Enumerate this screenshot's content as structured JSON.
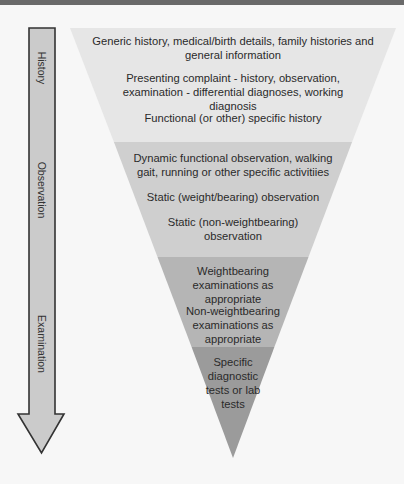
{
  "colors": {
    "background": "#f7f7f7",
    "header_bar": "#6a6a6a",
    "band_1": "#e6e6e6",
    "band_2": "#cfcfcf",
    "band_3": "#b5b5b5",
    "band_4": "#9b9b9b",
    "arrow_fill": "#cbcbcb",
    "arrow_stroke": "#333333"
  },
  "arrow": {
    "labels": [
      "History",
      "Observation",
      "Examination"
    ]
  },
  "funnel": {
    "bands": [
      {
        "name": "history",
        "items": [
          "Generic history, medical/birth details, family histories and general information",
          "Presenting complaint - history, observation, examination - differential diagnoses, working diagnosis",
          "Functional (or other) specific history"
        ]
      },
      {
        "name": "observation",
        "items": [
          "Dynamic functional observation, walking gait, running or other specific activitiies",
          "Static (weight/bearing) observation",
          "Static (non-weightbearing) observation"
        ]
      },
      {
        "name": "examination",
        "items": [
          "Weightbearing examinations as appropriate",
          "Non-weightbearing examinations as appropriate"
        ]
      },
      {
        "name": "diagnostic-tests",
        "items": [
          "Specific diagnostic tests or lab tests"
        ]
      }
    ]
  }
}
